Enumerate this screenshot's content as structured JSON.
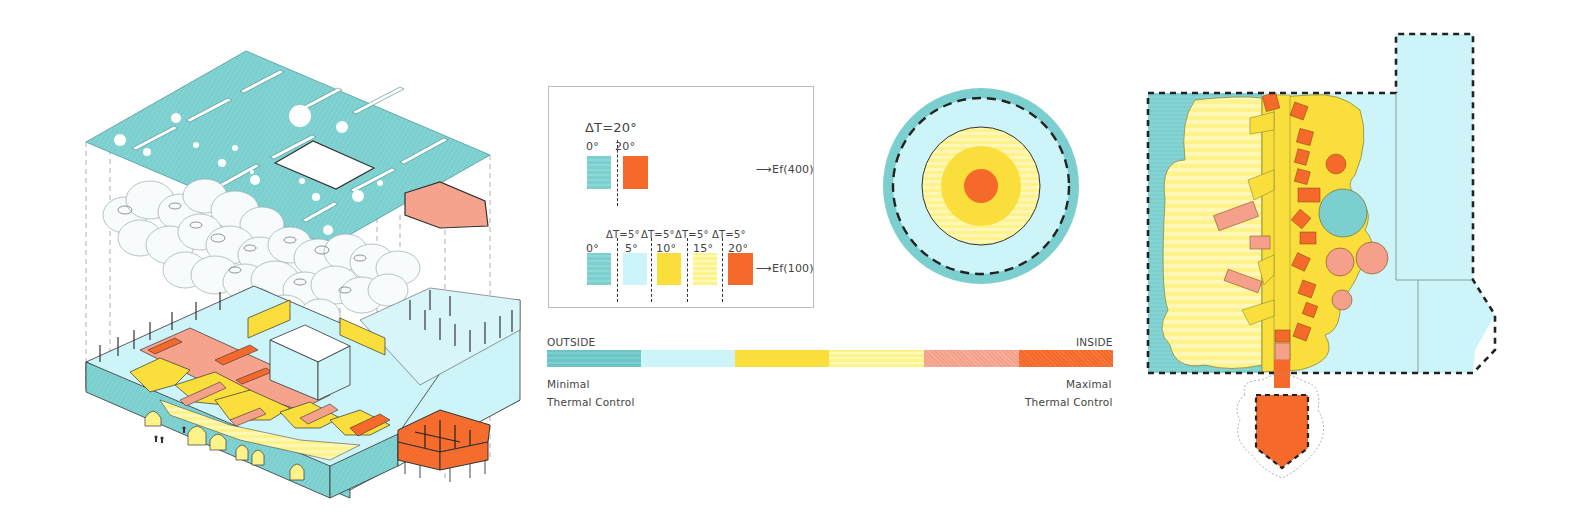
{
  "colors": {
    "teal": "#7ccfcf",
    "teal_dark": "#5fbcc0",
    "light_blue": "#cdf4f8",
    "yellow": "#f9de3c",
    "light_yellow": "#fdf38a",
    "salmon": "#f5a08a",
    "orange": "#f5692a",
    "outline": "#222222"
  },
  "legend": {
    "top_group": {
      "delta_label": "ΔT=20°",
      "swatches": [
        {
          "label": "0°",
          "color": "#7ccfcf"
        },
        {
          "label": "20°",
          "color": "#f5692a"
        }
      ],
      "result": "Ef(400)"
    },
    "bottom_group": {
      "deltas": [
        "ΔT=5°",
        "ΔT=5°",
        "ΔT=5°",
        "ΔT=5°"
      ],
      "swatches": [
        {
          "label": "0°",
          "color": "#7ccfcf"
        },
        {
          "label": "5°",
          "color": "#cdf4f8"
        },
        {
          "label": "10°",
          "color": "#f9de3c"
        },
        {
          "label": "15°",
          "color": "#fdf38a"
        },
        {
          "label": "20°",
          "color": "#f5692a"
        }
      ],
      "result": "Ef(100)"
    }
  },
  "gradient_scale": {
    "left_label": "OUTSIDE",
    "right_label": "INSIDE",
    "left_caption_1": "Minimal",
    "left_caption_2": "Thermal Control",
    "right_caption_1": "Maximal",
    "right_caption_2": "Thermal Control",
    "segments": [
      "#7ccfcf",
      "#cdf4f8",
      "#f9de3c",
      "#fdf38a",
      "#f5a08a",
      "#f5692a"
    ]
  },
  "diagrams": {
    "axonometric": "exploded-axonometric-building",
    "concentric": "concentric-thermal-rings",
    "plan": "thermal-zone-floor-plan"
  }
}
